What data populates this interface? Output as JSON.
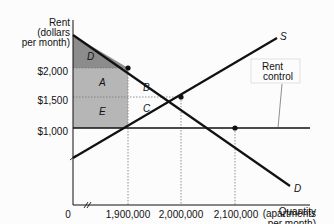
{
  "chart_data": {
    "type": "line",
    "title": "",
    "xlabel": "Quantity (apartments per month)",
    "ylabel": "Rent (dollars per month)",
    "axis_labels": {
      "y": [
        "Rent",
        "(dollars",
        "per month)"
      ],
      "x": [
        "Quantity",
        "(apartments",
        "per month)"
      ]
    },
    "x_ticks": [
      "0",
      "1,900,000",
      "2,000,000",
      "2,100,000"
    ],
    "y_ticks": [
      "$1,000",
      "$1,500",
      "$2,000"
    ],
    "x_origin_label": "0",
    "series": [
      {
        "name": "S",
        "label": "S",
        "description": "Supply curve",
        "points": [
          [
            1800000,
            600
          ],
          [
            1900000,
            1000
          ],
          [
            2000000,
            1500
          ],
          [
            2200000,
            2300
          ]
        ]
      },
      {
        "name": "D",
        "label": "D",
        "description": "Demand curve",
        "points": [
          [
            1800000,
            2500
          ],
          [
            1900000,
            2000
          ],
          [
            2000000,
            1500
          ],
          [
            2100000,
            1000
          ],
          [
            2200000,
            550
          ]
        ]
      },
      {
        "name": "Rent control",
        "label": "Rent control",
        "description": "Price ceiling",
        "y": 1000
      }
    ],
    "equilibrium": {
      "quantity": 2000000,
      "rent": 1500
    },
    "points_marked": [
      [
        1900000,
        2000
      ],
      [
        2000000,
        1500
      ],
      [
        2100000,
        1000
      ]
    ],
    "regions": [
      {
        "label": "D",
        "shade": "dark"
      },
      {
        "label": "A",
        "shade": "medium"
      },
      {
        "label": "B",
        "shade": "none"
      },
      {
        "label": "C",
        "shade": "none"
      },
      {
        "label": "E",
        "shade": "medium"
      }
    ],
    "annotations": [
      {
        "text": "Rent control",
        "lines": [
          "Rent",
          "control"
        ]
      }
    ],
    "axis_break": true,
    "grid": false,
    "legend": "none"
  },
  "colors": {
    "line": "#111111",
    "dark_shade": "#8a8a8a",
    "medium_shade": "#b4b4b4",
    "dotted": "#666666",
    "background": "#fcfcfc"
  }
}
